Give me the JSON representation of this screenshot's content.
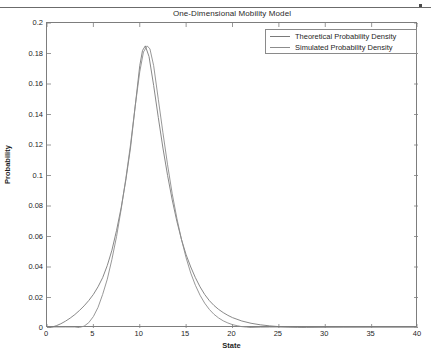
{
  "page": {
    "rule_name": "scanned-page-rule"
  },
  "chart_data": {
    "type": "line",
    "title": "One-Dimensional Mobility Model",
    "xlabel": "State",
    "ylabel": "Probability",
    "xlim": [
      0,
      40
    ],
    "ylim": [
      0,
      0.2
    ],
    "xticks": [
      0,
      5,
      10,
      15,
      20,
      25,
      30,
      35,
      40
    ],
    "xtick_labels": [
      "0",
      "5",
      "10",
      "15",
      "20",
      "25",
      "30",
      "35",
      "40"
    ],
    "yticks": [
      0,
      0.02,
      0.04,
      0.06,
      0.08,
      0.1,
      0.12,
      0.14,
      0.16,
      0.18,
      0.2
    ],
    "ytick_labels": [
      "0",
      "0.02",
      "0.04",
      "0.06",
      "0.08",
      "0.1",
      "0.12",
      "0.14",
      "0.16",
      "0.18",
      "0.2"
    ],
    "grid": false,
    "legend_position": "upper right",
    "legend": [
      "Theoretical Probability Density",
      "Simulated Probability Density"
    ],
    "line_color": "#7a7a7a",
    "series": [
      {
        "name": "Theoretical Probability Density",
        "color": "#7a7a7a",
        "x": [
          0,
          0.5,
          1,
          1.5,
          2,
          2.5,
          3,
          3.5,
          4,
          4.5,
          5,
          5.5,
          6,
          6.5,
          7,
          7.5,
          8,
          8.5,
          9,
          9.5,
          10,
          10.3,
          10.6,
          11,
          11.5,
          12,
          12.5,
          13,
          13.5,
          14,
          14.5,
          15,
          15.5,
          16,
          16.5,
          17,
          17.5,
          18,
          18.5,
          19,
          19.5,
          20,
          21,
          22,
          23,
          24,
          25,
          26,
          27,
          28,
          30,
          32,
          35,
          40
        ],
        "y": [
          0.0,
          0.0005,
          0.0015,
          0.0028,
          0.0045,
          0.0065,
          0.0088,
          0.0115,
          0.0145,
          0.018,
          0.022,
          0.027,
          0.033,
          0.041,
          0.051,
          0.064,
          0.079,
          0.097,
          0.118,
          0.145,
          0.172,
          0.182,
          0.185,
          0.178,
          0.159,
          0.138,
          0.118,
          0.1,
          0.084,
          0.07,
          0.058,
          0.048,
          0.04,
          0.033,
          0.027,
          0.022,
          0.018,
          0.0148,
          0.0122,
          0.0101,
          0.0083,
          0.0068,
          0.0046,
          0.0031,
          0.0021,
          0.0014,
          0.0009,
          0.0006,
          0.0004,
          0.00027,
          0.00012,
          5e-05,
          1e-05,
          0.0
        ]
      },
      {
        "name": "Simulated Probability Density",
        "color": "#8c8c8c",
        "x": [
          0,
          1,
          2,
          3,
          3.5,
          4,
          4.5,
          5,
          5.5,
          6,
          6.5,
          7,
          7.5,
          8,
          8.5,
          9,
          9.5,
          10,
          10.4,
          10.8,
          11.1,
          11.5,
          12,
          12.5,
          13,
          13.5,
          14,
          14.5,
          15,
          15.5,
          16,
          16.5,
          17,
          17.5,
          18,
          18.5,
          19,
          19.5,
          20,
          20.5,
          21,
          21.5,
          22,
          23,
          24,
          25,
          27,
          30,
          35,
          40
        ],
        "y": [
          0.0,
          0.0,
          0.0,
          0.0,
          0.0004,
          0.0012,
          0.0035,
          0.0075,
          0.0135,
          0.022,
          0.032,
          0.045,
          0.06,
          0.078,
          0.098,
          0.12,
          0.145,
          0.168,
          0.181,
          0.185,
          0.183,
          0.172,
          0.15,
          0.128,
          0.107,
          0.088,
          0.072,
          0.058,
          0.046,
          0.036,
          0.028,
          0.0215,
          0.0163,
          0.0122,
          0.009,
          0.0066,
          0.0047,
          0.0033,
          0.0022,
          0.0015,
          0.0009,
          0.0006,
          0.0003,
          0.0001,
          3e-05,
          0.0,
          0.0,
          0.0,
          0.0,
          0.0
        ]
      }
    ]
  }
}
